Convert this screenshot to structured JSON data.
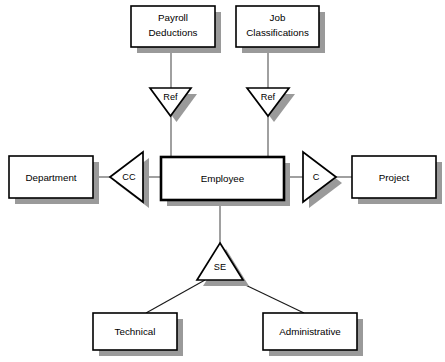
{
  "diagram": {
    "type": "entity-relationship-diagram",
    "colors": {
      "background": "#ffffff",
      "entity_fill": "#ffffff",
      "entity_stroke": "#000000",
      "shadow": "#9a9a9a",
      "connector": "#5a5a5a"
    },
    "entities": [
      {
        "id": "payroll_deductions",
        "label_line1": "Payroll",
        "label_line2": "Deductions",
        "x": 131,
        "y": 6,
        "w": 84,
        "h": 41,
        "strong": false
      },
      {
        "id": "job_classifications",
        "label_line1": "Job",
        "label_line2": "Classifications",
        "x": 236,
        "y": 6,
        "w": 83,
        "h": 41,
        "strong": false
      },
      {
        "id": "department",
        "label_line1": "Department",
        "label_line2": "",
        "x": 9,
        "y": 156,
        "w": 84,
        "h": 42,
        "strong": false
      },
      {
        "id": "employee",
        "label_line1": "Employee",
        "label_line2": "",
        "x": 161,
        "y": 157,
        "w": 123,
        "h": 43,
        "strong": true
      },
      {
        "id": "project",
        "label_line1": "Project",
        "label_line2": "",
        "x": 352,
        "y": 156,
        "w": 84,
        "h": 42,
        "strong": false
      },
      {
        "id": "technical",
        "label_line1": "Technical",
        "label_line2": "",
        "x": 93,
        "y": 313,
        "w": 84,
        "h": 37,
        "strong": false
      },
      {
        "id": "administrative",
        "label_line1": "Administrative",
        "label_line2": "",
        "x": 263,
        "y": 313,
        "w": 94,
        "h": 37,
        "strong": false
      }
    ],
    "relationships": [
      {
        "id": "ref_payroll",
        "label": "Ref",
        "direction": "down",
        "cx": 170.5,
        "cy": 88,
        "half_width": 20.5,
        "height": 28
      },
      {
        "id": "ref_job",
        "label": "Ref",
        "direction": "down",
        "cx": 268,
        "cy": 88,
        "half_width": 21,
        "height": 28
      },
      {
        "id": "cc_department",
        "label": "CC",
        "direction": "left",
        "cx": 110,
        "cy": 177,
        "half_height": 25,
        "length": 33
      },
      {
        "id": "c_project",
        "label": "C",
        "direction": "right",
        "cx": 336,
        "cy": 177,
        "half_height": 25,
        "length": 33
      },
      {
        "id": "se_subtype",
        "label": "SE",
        "direction": "up",
        "cx": 220,
        "cy": 243,
        "half_width": 23,
        "height": 37
      }
    ],
    "connectors": [
      {
        "id": "payroll-to-ref",
        "from": "payroll_deductions",
        "to": "ref_payroll"
      },
      {
        "id": "ref-to-employee-left",
        "from": "ref_payroll",
        "to": "employee"
      },
      {
        "id": "job-to-ref",
        "from": "job_classifications",
        "to": "ref_job"
      },
      {
        "id": "ref-to-employee-right",
        "from": "ref_job",
        "to": "employee"
      },
      {
        "id": "department-to-cc",
        "from": "department",
        "to": "cc_department"
      },
      {
        "id": "cc-to-employee",
        "from": "cc_department",
        "to": "employee"
      },
      {
        "id": "employee-to-c",
        "from": "employee",
        "to": "c_project"
      },
      {
        "id": "c-to-project",
        "from": "c_project",
        "to": "project"
      },
      {
        "id": "employee-to-se",
        "from": "employee",
        "to": "se_subtype"
      },
      {
        "id": "se-to-technical",
        "from": "se_subtype",
        "to": "technical"
      },
      {
        "id": "se-to-administrative",
        "from": "se_subtype",
        "to": "administrative"
      }
    ]
  }
}
